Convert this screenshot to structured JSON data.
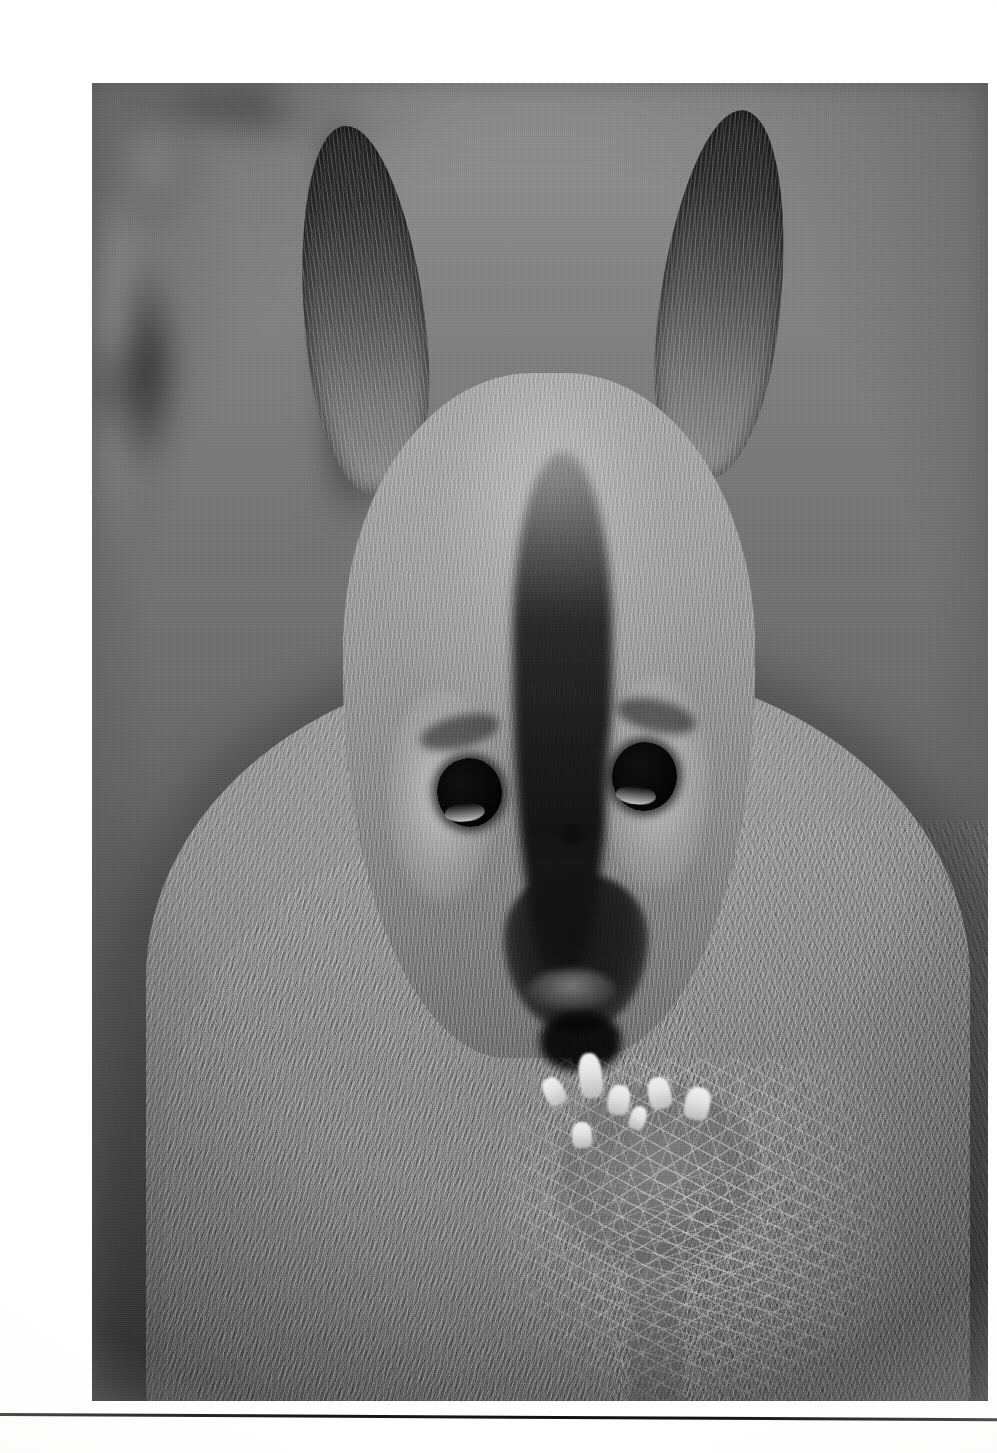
{
  "page": {
    "kind": "scanned-printed-page",
    "background_color": "#ffffff",
    "width_px": 997,
    "height_px": 1453,
    "has_visible_text": false,
    "caption": "",
    "page_number": ""
  },
  "photograph": {
    "name": "wallaby-photograph",
    "alt": "Black and white close-up photograph of a wallaby feeding on a thistle flower",
    "subject": "red-necked wallaby",
    "action": "eating a spiky thistle flower head",
    "orientation": "portrait",
    "color_mode": "black-and-white",
    "frame": {
      "left_px": 52,
      "top_px": 67,
      "width_px": 896,
      "height_px": 1318
    },
    "tones": {
      "shadow": "#141414",
      "dark_mid": "#3a3a3a",
      "mid": "#8a8a8a",
      "light_mid": "#b4b4b4",
      "highlight": "#f2f2f2"
    },
    "elements": {
      "background": "out-of-focus grey bokeh foliage, lighter at upper-left, dark blurred shapes at right",
      "ears": "two tall upright ears with near-black tips and pale inner fur strands",
      "eyes": "two large dark round eyes with thin crescent catchlights along the lower rims",
      "face_stripe": "dark vertical stripe running from forehead down the muzzle",
      "cheeks": "pale light-grey cheek patches on either side of the muzzle",
      "muzzle": "dark blunt muzzle with pale lip band and open mouth below",
      "chest": "broad body covered in long streaked fur",
      "plant": "thistle with radiating pale spines and bright white floret tufts at the mouth"
    }
  },
  "divider": {
    "name": "bottom-rule",
    "color": "#141414",
    "left_px": 0,
    "top_px": 1413,
    "width_px": 997,
    "thickness_px": 3,
    "tilt_deg": 0.3
  }
}
